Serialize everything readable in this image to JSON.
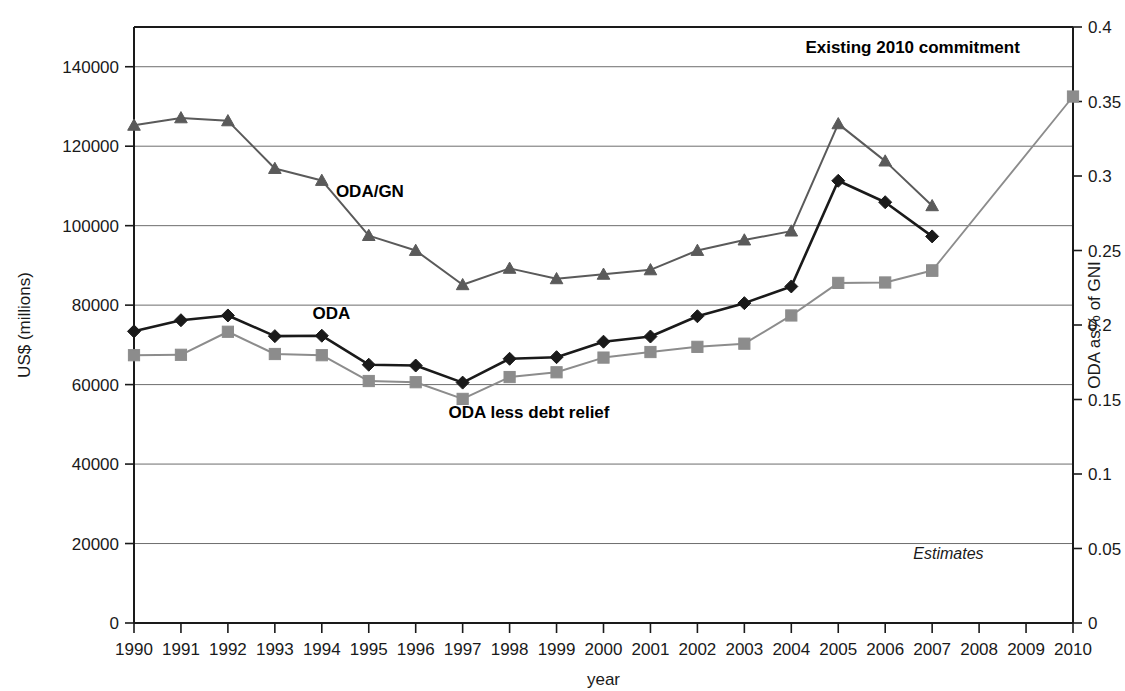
{
  "chart_data": {
    "type": "line",
    "title": "",
    "xlabel": "year",
    "ylabel": "US$ (millions)",
    "y2label": "ODA as% of GNI",
    "x": [
      1990,
      1991,
      1992,
      1993,
      1994,
      1995,
      1996,
      1997,
      1998,
      1999,
      2000,
      2001,
      2002,
      2003,
      2004,
      2005,
      2006,
      2007,
      2008,
      2009,
      2010
    ],
    "categories": [
      "1990",
      "1991",
      "1992",
      "1993",
      "1994",
      "1995",
      "1996",
      "1997",
      "1998",
      "1999",
      "2000",
      "2001",
      "2002",
      "2003",
      "2004",
      "2005",
      "2006",
      "2007",
      "2008",
      "2009",
      "2010"
    ],
    "ylim": [
      0,
      150000
    ],
    "yticks": [
      0,
      20000,
      40000,
      60000,
      80000,
      100000,
      120000,
      140000
    ],
    "ytick_labels": [
      "0",
      "20000",
      "40000",
      "60000",
      "80000",
      "100000",
      "120000",
      "140000"
    ],
    "y2lim": [
      0,
      0.4
    ],
    "y2ticks": [
      0,
      0.05,
      0.1,
      0.15,
      0.2,
      0.25,
      0.3,
      0.35,
      0.4
    ],
    "y2tick_labels": [
      "0",
      "0.05",
      "0.1",
      "0.15",
      "0.2",
      "0.25",
      "0.3",
      "0.35",
      "0.4"
    ],
    "grid": true,
    "legend_position": "inline-annotations",
    "series": [
      {
        "name": "ODA",
        "label": "ODA",
        "axis": "left",
        "marker": "diamond",
        "color": "#1a1a1a",
        "line_width": 2.6,
        "x": [
          1990,
          1991,
          1992,
          1993,
          1994,
          1995,
          1996,
          1997,
          1998,
          1999,
          2000,
          2001,
          2002,
          2003,
          2004,
          2005,
          2006,
          2007
        ],
        "values": [
          73400,
          76200,
          77400,
          72200,
          72300,
          65000,
          64800,
          60500,
          66500,
          66900,
          70800,
          72100,
          77200,
          80500,
          84700,
          111300,
          105900,
          97300
        ]
      },
      {
        "name": "ODA less debt relief",
        "label": "ODA less debt relief",
        "axis": "left",
        "marker": "square",
        "color": "#8c8c8c",
        "line_width": 2.0,
        "x": [
          1990,
          1991,
          1992,
          1993,
          1994,
          1995,
          1996,
          1997,
          1998,
          1999,
          2000,
          2001,
          2002,
          2003,
          2004,
          2005,
          2006,
          2007
        ],
        "values": [
          67400,
          67500,
          73300,
          67700,
          67400,
          60900,
          60600,
          56400,
          61900,
          63100,
          66800,
          68200,
          69500,
          70300,
          77400,
          85600,
          85700,
          88700
        ]
      },
      {
        "name": "ODA/GN",
        "label": "ODA/GN",
        "axis": "right",
        "marker": "triangle",
        "color": "#5a5a5a",
        "line_width": 2.0,
        "x": [
          1990,
          1991,
          1992,
          1993,
          1994,
          1995,
          1996,
          1997,
          1998,
          1999,
          2000,
          2001,
          2002,
          2003,
          2004,
          2005,
          2006,
          2007
        ],
        "values": [
          0.334,
          0.339,
          0.337,
          0.305,
          0.297,
          0.26,
          0.25,
          0.227,
          0.238,
          0.231,
          0.234,
          0.237,
          0.25,
          0.257,
          0.263,
          0.335,
          0.31,
          0.28
        ]
      },
      {
        "name": "Existing 2010 commitment",
        "label": "Existing 2010 commitment",
        "axis": "left",
        "marker": "square",
        "color": "#8c8c8c",
        "line_width": 1.8,
        "projection": true,
        "x": [
          2007,
          2010
        ],
        "values": [
          88700,
          132500
        ]
      }
    ],
    "annotations": [
      {
        "name": "oda-gni-label",
        "text": "ODA/GN",
        "x": 1994.3,
        "y_value": 0.286,
        "axis": "right",
        "style": "bold"
      },
      {
        "name": "oda-label",
        "text": "ODA",
        "x": 1993.8,
        "y_value": 76500,
        "axis": "left",
        "style": "bold"
      },
      {
        "name": "oda-less-debt-relief-label",
        "text": "ODA less debt relief",
        "x": 1996.7,
        "y_value": 51500,
        "axis": "left",
        "style": "bold"
      },
      {
        "name": "existing-commitment-label",
        "text": "Existing 2010 commitment",
        "x": 2004.3,
        "y_value": 143500,
        "axis": "left",
        "style": "bold"
      },
      {
        "name": "estimates-label",
        "text": "Estimates",
        "x": 2006.6,
        "y_value": 16000,
        "axis": "left",
        "style": "italic"
      }
    ]
  }
}
